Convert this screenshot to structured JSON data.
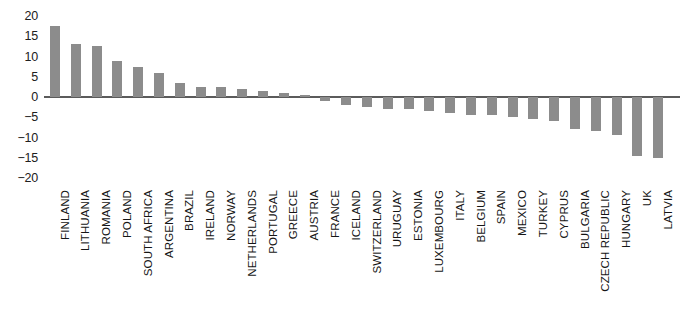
{
  "chart_data": {
    "type": "bar",
    "title": "",
    "subtitle": "",
    "xlabel": "",
    "ylabel": "",
    "ylim": [
      -20,
      20
    ],
    "yticks": [
      20,
      15,
      10,
      5,
      0,
      -5,
      -10,
      -15,
      -20
    ],
    "ytick_labels": [
      "20",
      "15",
      "10",
      "5",
      "0",
      "−5",
      "−10",
      "−15",
      "−20"
    ],
    "grid": false,
    "legend": false,
    "bar_color": "#8c8c8c",
    "axis_color": "#5b5b5b",
    "categories": [
      "FINLAND",
      "LITHUANIA",
      "ROMANIA",
      "POLAND",
      "SOUTH AFRICA",
      "ARGENTINA",
      "BRAZIL",
      "IRELAND",
      "NORWAY",
      "NETHERLANDS",
      "PORTUGAL",
      "GREECE",
      "AUSTRIA",
      "FRANCE",
      "ICELAND",
      "SWITZERLAND",
      "URUGUAY",
      "ESTONIA",
      "LUXEMBOURG",
      "ITALY",
      "BELGIUM",
      "SPAIN",
      "MEXICO",
      "TURKEY",
      "CYPRUS",
      "BULGARIA",
      "CZECH REPUBLIC",
      "HUNGARY",
      "UK",
      "LATVIA"
    ],
    "values": [
      17.5,
      13,
      12.5,
      9,
      7.5,
      6,
      3.5,
      2.5,
      2.5,
      2,
      1.5,
      1,
      0.5,
      -1,
      -2,
      -2.5,
      -3,
      -3,
      -3.5,
      -4,
      -4.5,
      -4.5,
      -5,
      -5.5,
      -6,
      -8,
      -8.5,
      -9.5,
      -14.5,
      -15
    ]
  }
}
